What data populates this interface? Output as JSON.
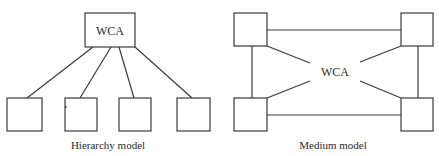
{
  "diagrams": [
    {
      "id": "hierarchy",
      "caption": "Hierarchy model",
      "center_label": "WCA",
      "child_count": 4
    },
    {
      "id": "medium",
      "caption": "Medium model",
      "center_label": "WCA",
      "node_count": 4
    }
  ],
  "colors": {
    "stroke": "#3a3a3a",
    "text": "#2a2a2a",
    "background": "#ffffff"
  }
}
